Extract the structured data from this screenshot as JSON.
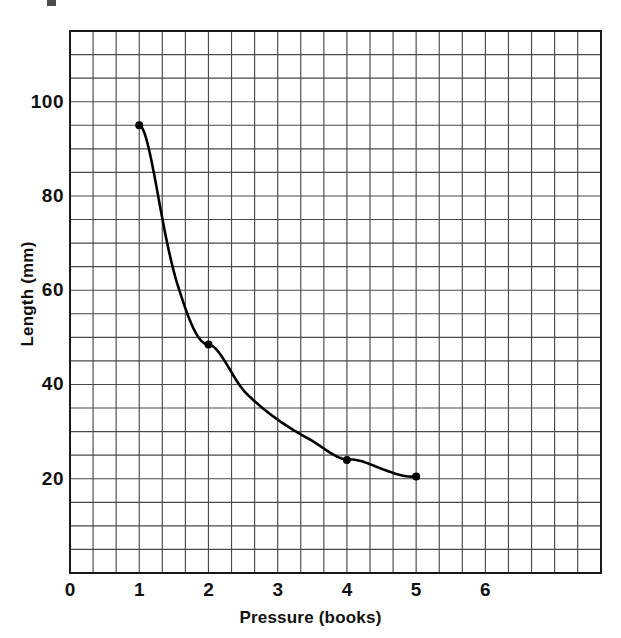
{
  "chart_data": {
    "type": "line",
    "title": "",
    "xlabel": "Pressure (books)",
    "ylabel": "Length (mm)",
    "xlim": [
      0,
      7.67
    ],
    "ylim": [
      0,
      115
    ],
    "x": [
      1,
      2,
      4,
      5
    ],
    "values": [
      95,
      48.5,
      24,
      20.5
    ],
    "series": [
      {
        "name": "Length vs Pressure",
        "x": [
          1,
          2,
          4,
          5
        ],
        "values": [
          95,
          48.5,
          24,
          20.5
        ]
      }
    ],
    "xticks": [
      0,
      1,
      2,
      3,
      4,
      5,
      6
    ],
    "xticklabels": [
      "0",
      "1",
      "2",
      "3",
      "4",
      "5",
      "6"
    ],
    "yticks": [
      20,
      40,
      60,
      80,
      100
    ],
    "yticklabels": [
      "20",
      "40",
      "60",
      "80",
      "100"
    ],
    "grid": true,
    "grid_minor_x_per_unit": 3,
    "grid_minor_y_step": 5,
    "legend": "none",
    "marker": "filled-circle",
    "line_color": "#000000",
    "grid_color": "#4a4a4a",
    "axis_color": "#000000",
    "background": "#ffffff"
  },
  "axes": {
    "x_title": "Pressure (books)",
    "y_title": "Length (mm)",
    "x_tick_labels": [
      "0",
      "1",
      "2",
      "3",
      "4",
      "5",
      "6"
    ],
    "y_tick_labels": [
      "100",
      "80",
      "60",
      "40",
      "20"
    ]
  }
}
